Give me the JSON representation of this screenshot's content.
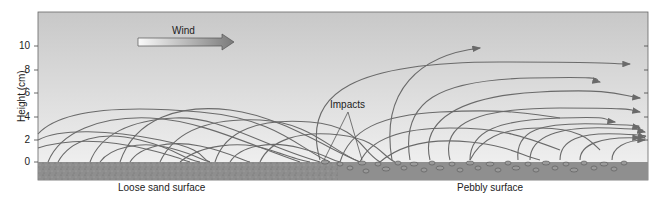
{
  "axis": {
    "ylabel": "Height (cm)",
    "ticks": [
      {
        "label": "0",
        "y": 162
      },
      {
        "label": "2",
        "y": 140
      },
      {
        "label": "4",
        "y": 117
      },
      {
        "label": "6",
        "y": 93
      },
      {
        "label": "8",
        "y": 70
      },
      {
        "label": "10",
        "y": 46
      }
    ]
  },
  "labels": {
    "wind": "Wind",
    "impacts": "Impacts",
    "loose_sand": "Loose sand surface",
    "pebbly": "Pebbly surface"
  },
  "colors": {
    "sky_top": "#c9c9c9",
    "sky_bottom": "#f2f2f2",
    "ground": "#8f8f8f",
    "trajectory": "#6a6a6a",
    "pebble": "#9a9a9a",
    "pebble_stroke": "#555555",
    "frame": "#666666"
  }
}
